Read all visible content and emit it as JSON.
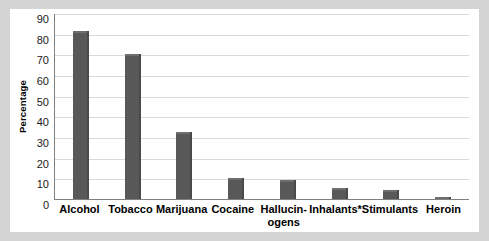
{
  "chart_data": {
    "type": "bar",
    "title": "",
    "subtitle": "",
    "xlabel": "",
    "ylabel": "Percentage",
    "ylim": [
      0,
      90
    ],
    "ytick_step": 10,
    "yticks": [
      90,
      80,
      70,
      60,
      50,
      40,
      30,
      20,
      10,
      0
    ],
    "grid": true,
    "legend": "none",
    "categories": [
      "Alcohol",
      "Tobacco",
      "Marijuana",
      "Cocaine",
      "Hallucin-ogens",
      "Inhalants*",
      "Stimulants",
      "Heroin"
    ],
    "category_lines": [
      [
        "Alcohol"
      ],
      [
        "Tobacco"
      ],
      [
        "Marijuana"
      ],
      [
        "Cocaine"
      ],
      [
        "Hallucin-",
        "ogens"
      ],
      [
        "Inhalants*"
      ],
      [
        "Stimulants"
      ],
      [
        "Heroin"
      ]
    ],
    "values": [
      81.5,
      70,
      32.5,
      10.3,
      9.3,
      5.5,
      4.5,
      0.8
    ],
    "bar_color": "#585858",
    "grid_color": "#d9d9d9",
    "axis_color": "#808080"
  }
}
